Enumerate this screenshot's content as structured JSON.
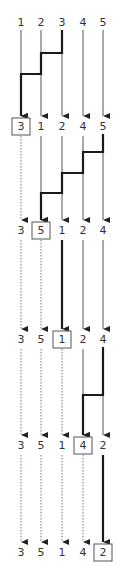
{
  "columns_x": [
    21,
    41,
    62,
    83,
    103
  ],
  "rows": [
    {
      "y": 22,
      "values": [
        "1",
        "2",
        "3",
        "4",
        "5"
      ],
      "boxed": null
    },
    {
      "y": 126,
      "values": [
        "3",
        "1",
        "2",
        "4",
        "5"
      ],
      "boxed": 0
    },
    {
      "y": 230,
      "values": [
        "3",
        "5",
        "1",
        "2",
        "4"
      ],
      "boxed": 1
    },
    {
      "y": 339,
      "values": [
        "3",
        "5",
        "1",
        "2",
        "4"
      ],
      "boxed": 2
    },
    {
      "y": 445,
      "values": [
        "3",
        "5",
        "1",
        "4",
        "2"
      ],
      "boxed": 3
    },
    {
      "y": 552,
      "values": [
        "3",
        "5",
        "1",
        "4",
        "2"
      ],
      "boxed": 4
    }
  ],
  "transitions": [
    {
      "lines": [
        "thin",
        "thin",
        "none",
        "thin",
        "thin"
      ],
      "path": [
        [
          2,
          30
        ],
        [
          2,
          53
        ],
        [
          1,
          53
        ],
        [
          1,
          74
        ],
        [
          0,
          74
        ],
        [
          0,
          116
        ]
      ],
      "thin_extra": [
        [
          2,
          53,
          116
        ]
      ]
    },
    {
      "lines": [
        "dotted",
        "thin",
        "thin",
        "thin",
        "none"
      ],
      "path": [
        [
          4,
          134
        ],
        [
          4,
          152
        ],
        [
          3,
          152
        ],
        [
          3,
          173
        ],
        [
          2,
          173
        ],
        [
          2,
          193
        ],
        [
          1,
          193
        ],
        [
          1,
          220
        ]
      ],
      "thin_extra": [
        [
          4,
          152,
          220
        ]
      ]
    },
    {
      "lines": [
        "dotted",
        "dotted",
        "bold",
        "thin",
        "thin"
      ],
      "path": [],
      "thin_extra": []
    },
    {
      "lines": [
        "dotted",
        "dotted",
        "dotted",
        "thin",
        "none"
      ],
      "path": [
        [
          4,
          347
        ],
        [
          4,
          395
        ],
        [
          3,
          395
        ],
        [
          3,
          435
        ]
      ],
      "thin_extra": [
        [
          4,
          395,
          435
        ]
      ]
    },
    {
      "lines": [
        "dotted",
        "dotted",
        "dotted",
        "dotted",
        "bold"
      ],
      "path": [],
      "thin_extra": []
    }
  ],
  "colors": {
    "line": "#555555",
    "bold": "#1a1a1a",
    "dotted": "#777777",
    "box": "#555555",
    "text": "#333333"
  }
}
